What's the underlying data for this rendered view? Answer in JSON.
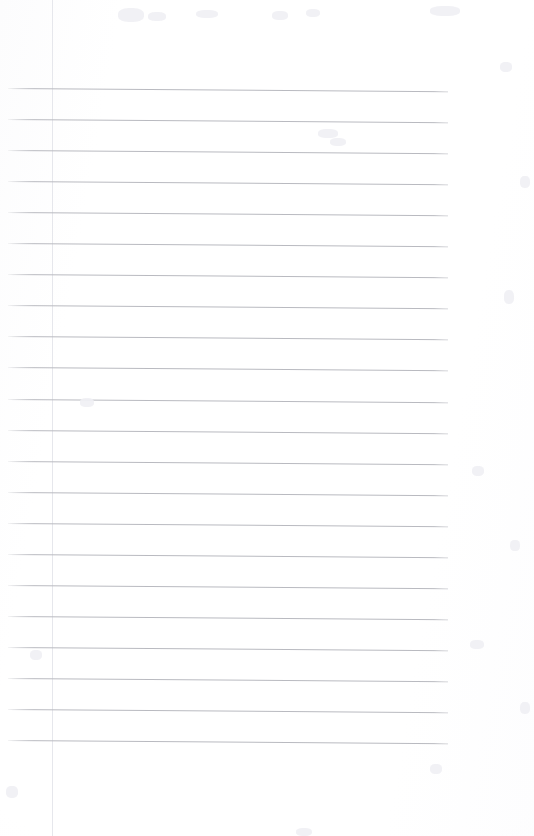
{
  "page": {
    "kind": "scanned-ruled-notebook-page",
    "width": 534,
    "height": 836,
    "background_color": "#fefefe",
    "paper_tone_color": "#fcfcfd",
    "has_visible_text": false,
    "text_content": "",
    "title": "",
    "notes": ""
  },
  "ruling": {
    "line_color": "#b9bac0",
    "line_thickness_px": 1,
    "line_count": 22,
    "first_line_y": 88,
    "line_spacing_px": 31.05,
    "line_start_x": 8,
    "line_end_x": 448,
    "skew_degrees": 0.42,
    "top_margin_px": 88,
    "bottom_blank_px": 96
  },
  "artifacts": {
    "seam_x": 52,
    "seam_color": "#e6e7ec",
    "vignette_color": "#f6f6f8",
    "specks": [
      {
        "x": 118,
        "y": 8,
        "w": 26,
        "h": 14
      },
      {
        "x": 430,
        "y": 6,
        "w": 30,
        "h": 10
      },
      {
        "x": 148,
        "y": 12,
        "w": 18,
        "h": 9
      },
      {
        "x": 196,
        "y": 10,
        "w": 22,
        "h": 8
      },
      {
        "x": 272,
        "y": 11,
        "w": 16,
        "h": 9
      },
      {
        "x": 306,
        "y": 9,
        "w": 14,
        "h": 8
      },
      {
        "x": 500,
        "y": 62,
        "w": 12,
        "h": 10
      },
      {
        "x": 520,
        "y": 176,
        "w": 10,
        "h": 12
      },
      {
        "x": 318,
        "y": 129,
        "w": 20,
        "h": 9
      },
      {
        "x": 330,
        "y": 138,
        "w": 16,
        "h": 8
      },
      {
        "x": 504,
        "y": 290,
        "w": 10,
        "h": 14
      },
      {
        "x": 80,
        "y": 398,
        "w": 14,
        "h": 9
      },
      {
        "x": 472,
        "y": 466,
        "w": 12,
        "h": 10
      },
      {
        "x": 510,
        "y": 540,
        "w": 10,
        "h": 11
      },
      {
        "x": 30,
        "y": 650,
        "w": 12,
        "h": 10
      },
      {
        "x": 470,
        "y": 640,
        "w": 14,
        "h": 9
      },
      {
        "x": 520,
        "y": 702,
        "w": 10,
        "h": 12
      },
      {
        "x": 430,
        "y": 764,
        "w": 12,
        "h": 10
      },
      {
        "x": 296,
        "y": 828,
        "w": 16,
        "h": 8
      },
      {
        "x": 6,
        "y": 786,
        "w": 12,
        "h": 12
      }
    ]
  }
}
